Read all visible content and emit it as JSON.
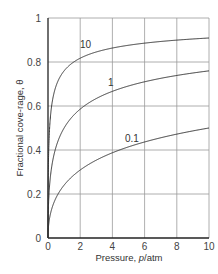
{
  "chart_data": {
    "type": "line",
    "title": "",
    "xlabel": "Pressure, p/atm",
    "xlabel_prefix": "Pressure, ",
    "xlabel_var": "p",
    "xlabel_unit": "/atm",
    "ylabel": "Fractional cove-rage, θ",
    "xlim": [
      0,
      10
    ],
    "ylim": [
      0,
      1
    ],
    "grid": true,
    "xticks": [
      "0",
      "2",
      "4",
      "6",
      "8",
      "10"
    ],
    "yticks": [
      "0",
      "0.2",
      "0.4",
      "0.6",
      "0.8",
      "1"
    ],
    "series": [
      {
        "name": "10",
        "K": 10,
        "x": [
          0,
          0.1,
          0.25,
          0.5,
          1,
          2,
          4,
          6,
          8,
          10
        ],
        "values": [
          0,
          0.5,
          0.61,
          0.69,
          0.76,
          0.82,
          0.86,
          0.89,
          0.9,
          0.91
        ]
      },
      {
        "name": "1",
        "K": 1,
        "x": [
          0,
          0.1,
          0.25,
          0.5,
          1,
          2,
          4,
          6,
          8,
          10
        ],
        "values": [
          0,
          0.24,
          0.33,
          0.41,
          0.5,
          0.59,
          0.67,
          0.71,
          0.74,
          0.76
        ]
      },
      {
        "name": "0.1",
        "K": 0.1,
        "x": [
          0,
          0.1,
          0.25,
          0.5,
          1,
          2,
          4,
          6,
          8,
          10
        ],
        "values": [
          0,
          0.09,
          0.14,
          0.18,
          0.24,
          0.31,
          0.39,
          0.44,
          0.47,
          0.5
        ]
      }
    ],
    "legend_position": "inline curve labels"
  }
}
